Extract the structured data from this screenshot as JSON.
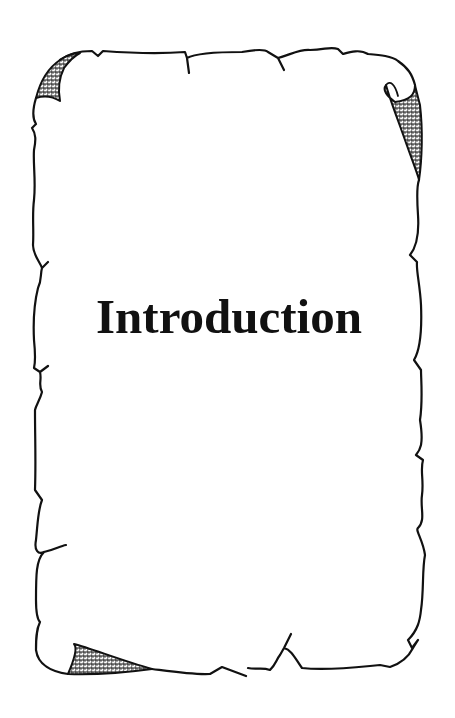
{
  "page": {
    "title": "Introduction",
    "decoration": "parchment-scroll-border",
    "colors": {
      "ink": "#111111",
      "paper": "#ffffff"
    }
  }
}
